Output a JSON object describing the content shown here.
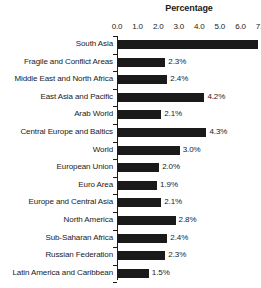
{
  "chart_data": {
    "type": "bar",
    "orientation": "horizontal",
    "title": "Percentage",
    "xlabel": "",
    "ylabel": "",
    "xlim": [
      0.0,
      7.0
    ],
    "xticks": [
      "0.0",
      "1.0",
      "2.0",
      "3.0",
      "4.0",
      "5.0",
      "6.0",
      "7.0"
    ],
    "xtick_values": [
      0.0,
      1.0,
      2.0,
      3.0,
      4.0,
      5.0,
      6.0,
      7.0
    ],
    "grid": false,
    "legend": false,
    "axis_position": "top",
    "bar_color": "#1a1a1a",
    "categories": [
      "South Asia",
      "Fragile and Conflict Areas",
      "Middle East and North Africa",
      "East Asia and Pacific",
      "Arab World",
      "Central Europe and Baltics",
      "World",
      "European Union",
      "Euro Area",
      "Europe and Central Asia",
      "North America",
      "Sub-Saharan Africa",
      "Russian Federation",
      "Latin America and Caribbean"
    ],
    "values": [
      6.8,
      2.3,
      2.4,
      4.2,
      2.1,
      4.3,
      3.0,
      2.0,
      1.9,
      2.1,
      2.8,
      2.4,
      2.3,
      1.5
    ],
    "value_labels": [
      "6.8%",
      "2.3%",
      "2.4%",
      "4.2%",
      "2.1%",
      "4.3%",
      "3.0%",
      "2.0%",
      "1.9%",
      "2.1%",
      "2.8%",
      "2.4%",
      "2.3%",
      "1.5%"
    ]
  }
}
